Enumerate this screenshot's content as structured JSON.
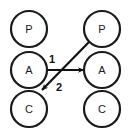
{
  "diagram": {
    "canvas": {
      "width": 129,
      "height": 137,
      "background": "#ffffff"
    },
    "style": {
      "node_fill": "#ffffff",
      "node_stroke": "#1a1a1a",
      "edge_color": "#111111",
      "label_color": "#1a1a1a"
    },
    "nodes": [
      {
        "id": "left-p",
        "label": "P",
        "cx": 29,
        "cy": 29,
        "r": 18
      },
      {
        "id": "left-a",
        "label": "A",
        "cx": 29,
        "cy": 70,
        "r": 18
      },
      {
        "id": "left-c",
        "label": "C",
        "cx": 29,
        "cy": 109,
        "r": 18
      },
      {
        "id": "right-p",
        "label": "P",
        "cx": 102,
        "cy": 29,
        "r": 18
      },
      {
        "id": "right-a",
        "label": "A",
        "cx": 102,
        "cy": 70,
        "r": 18
      },
      {
        "id": "right-c",
        "label": "C",
        "cx": 102,
        "cy": 109,
        "r": 18
      }
    ],
    "edges": [
      {
        "id": "edge-1",
        "label": "1",
        "from": "left-a",
        "to": "right-a",
        "x1": 47,
        "y1": 70,
        "x2": 84,
        "y2": 70,
        "label_x": 52,
        "label_y": 59
      },
      {
        "id": "edge-2",
        "label": "2",
        "from": "right-p",
        "to": "left-c",
        "x1": 89,
        "y1": 42,
        "x2": 42,
        "y2": 90,
        "label_x": 59,
        "label_y": 87
      }
    ]
  }
}
